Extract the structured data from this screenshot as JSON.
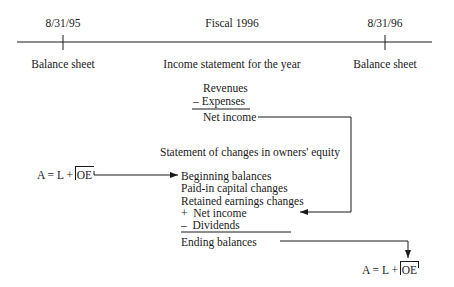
{
  "timeline": {
    "start_date": "8/31/95",
    "period": "Fiscal 1996",
    "end_date": "8/31/96",
    "start_statement": "Balance sheet",
    "period_statement": "Income statement for the year",
    "end_statement": "Balance sheet"
  },
  "income_statement": {
    "revenues": "Revenues",
    "expenses": "– Expenses",
    "net_income": "Net income"
  },
  "equity_statement": {
    "title": "Statement of changes in owners' equity",
    "items": [
      "Beginning balances",
      "Paid-in capital changes",
      "Retained earnings changes",
      "+  Net income",
      "–  Dividends"
    ],
    "ending": "Ending balances"
  },
  "equations": {
    "start": {
      "prefix": "A = L + ",
      "boxed": "OE"
    },
    "end": {
      "prefix": "A = L + ",
      "boxed": "OE"
    }
  },
  "colors": {
    "ink": "#1a1a1a",
    "background": "#ffffff"
  }
}
